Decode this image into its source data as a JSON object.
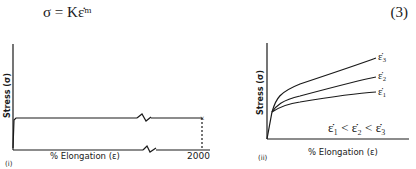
{
  "equation": {
    "text": "σ = Kε̇ᵐ",
    "number": "(3)"
  },
  "figure_i": {
    "panel_label": "(i)",
    "ylabel": "Stress (σ)",
    "xlabel": "% Elongation (ε)",
    "end_value": "2000"
  },
  "figure_ii": {
    "panel_label": "(ii)",
    "ylabel": "Stress (σ)",
    "xlabel": "% Elongation (ε)",
    "curve_labels": [
      "ε̇₃",
      "ε̇₂",
      "ε̇₁"
    ],
    "relation": "ε̇₁ < ε̇₂ < ε̇₃"
  }
}
